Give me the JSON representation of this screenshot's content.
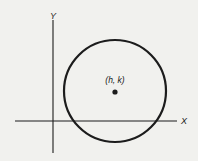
{
  "diagram": {
    "background": "#f1f1ee",
    "stroke_color": "#1c1c1c",
    "axes": {
      "x_label": "X",
      "y_label": "Y",
      "origin": [
        53,
        121
      ],
      "x_range_px": [
        15,
        177
      ],
      "y_range_px": [
        20,
        153
      ]
    },
    "circle": {
      "center_px": [
        115,
        91
      ],
      "radius_px": 51
    },
    "center_point": {
      "label": "(h, k)",
      "position_px": [
        115,
        92
      ]
    }
  }
}
